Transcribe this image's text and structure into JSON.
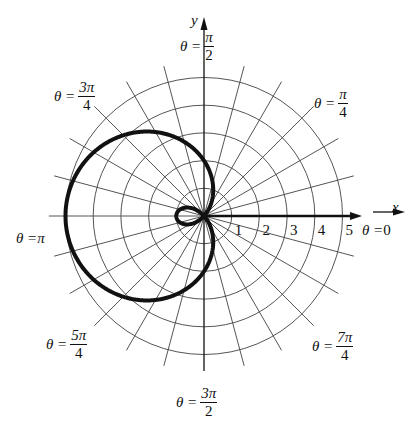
{
  "chart_data": {
    "type": "line",
    "subtype": "polar",
    "title": "",
    "equation_depicted": "r = 2 - 3cos(theta) (limaçon with inner loop)",
    "center_px": [
      204,
      216
    ],
    "px_per_unit": 27.7,
    "radial_ticks": [
      "1",
      "2",
      "3",
      "4",
      "5"
    ],
    "radial_grid": [
      1,
      2,
      3,
      4,
      5
    ],
    "angular_grid_step_deg": 15,
    "spoke_extent": 5.6,
    "xlabel": "x",
    "ylabel": "y",
    "angle_labels": [
      {
        "id": "a0",
        "prefix": "θ = ",
        "value": "0"
      },
      {
        "id": "a1",
        "prefix": "θ = ",
        "num": "π",
        "den": "4"
      },
      {
        "id": "a2",
        "prefix": "θ = ",
        "num": "π",
        "den": "2"
      },
      {
        "id": "a3",
        "prefix": "θ = ",
        "num": "3π",
        "den": "4"
      },
      {
        "id": "a4",
        "prefix": "θ = ",
        "value": "π"
      },
      {
        "id": "a5",
        "prefix": "θ = ",
        "num": "5π",
        "den": "4"
      },
      {
        "id": "a6",
        "prefix": "θ = ",
        "num": "3π",
        "den": "2"
      },
      {
        "id": "a7",
        "prefix": "θ = ",
        "num": "7π",
        "den": "4"
      }
    ],
    "curve": {
      "a": 2,
      "b": -3,
      "samples": [
        {
          "theta_deg": 0,
          "r": -1
        },
        {
          "theta_deg": 48.2,
          "r": 0
        },
        {
          "theta_deg": 90,
          "r": 2
        },
        {
          "theta_deg": 180,
          "r": 5
        },
        {
          "theta_deg": 270,
          "r": 2
        },
        {
          "theta_deg": 311.8,
          "r": 0
        }
      ],
      "stroke": "#111111",
      "stroke_width": 4
    },
    "grid_color": "#555555",
    "axis_color": "#111111",
    "grid": true,
    "legend": null
  }
}
